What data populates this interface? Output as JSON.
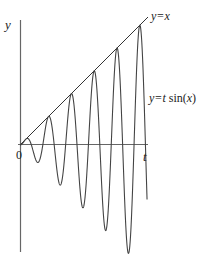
{
  "chart_data": {
    "type": "line",
    "title": "",
    "xlabel": "t",
    "ylabel": "y",
    "origin_label": "0",
    "grid": false,
    "legend": "none",
    "series": [
      {
        "name": "y=x",
        "function": "y = t",
        "t_range": [
          0,
          35
        ],
        "color": "#333333"
      },
      {
        "name": "y=t sin(x)",
        "function": "y = t*sin(t)",
        "t_range": [
          0,
          35
        ],
        "color": "#444444"
      }
    ],
    "annotations": [
      {
        "text": "y=x",
        "attached_to": "y=x",
        "position": "upper end of line"
      },
      {
        "text_main": "y=t ",
        "text_func": "sin(",
        "text_var": "x",
        "text_close": ")",
        "attached_to": "y=t sin(x)",
        "position": "right of curve end"
      }
    ],
    "approx_extrema": {
      "peaks_t": [
        7.85,
        14.14,
        20.42,
        26.7,
        32.99
      ],
      "peaks_y": [
        7.85,
        14.07,
        20.39,
        26.68,
        32.97
      ],
      "troughs_t": [
        4.81,
        11.09,
        17.34,
        23.62,
        29.9
      ],
      "troughs_y": [
        -4.81,
        -11.04,
        -17.3,
        -23.59,
        -29.88
      ]
    },
    "xlim": [
      0,
      35
    ],
    "ylim": [
      -31,
      34
    ]
  },
  "labels": {
    "y_axis": "y",
    "t_axis": "t",
    "origin": "0",
    "line_label": "y=x",
    "curve_label_a": "y=t ",
    "curve_label_b": "sin(",
    "curve_label_c": "x",
    "curve_label_d": ")"
  },
  "colors": {
    "axis": "#555555",
    "line": "#333333",
    "curve": "#444444"
  }
}
